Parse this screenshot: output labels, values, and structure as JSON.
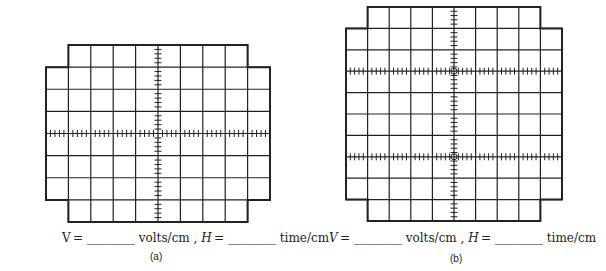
{
  "figures": [
    {
      "id": "a",
      "label": "(a)",
      "caption": {
        "v_prefix": "V =",
        "v_unit": "volts/cm ,",
        "h_prefix": "H =",
        "h_unit": "time/cm",
        "blank": "________"
      },
      "grid": {
        "cols": 10,
        "rows": 8,
        "left": 46,
        "top": 45,
        "right": 270,
        "bottom": 222,
        "notch_cols": 1,
        "notch_rows": 1,
        "tick_rows": [
          4
        ],
        "center_col": 5
      }
    },
    {
      "id": "b",
      "label": "(b)",
      "caption": {
        "v_prefix": "V =",
        "v_unit": "volts/cm ,",
        "h_prefix": "H =",
        "h_unit": "time/cm",
        "blank": "________"
      },
      "grid": {
        "cols": 10,
        "rows": 10,
        "left": 346,
        "top": 7,
        "right": 562,
        "bottom": 221,
        "notch_cols": 1,
        "notch_rows": 1,
        "tick_rows": [
          3,
          7
        ],
        "center_col": 5
      }
    }
  ],
  "colors": {
    "line": "#222222",
    "background": "#ffffff"
  }
}
